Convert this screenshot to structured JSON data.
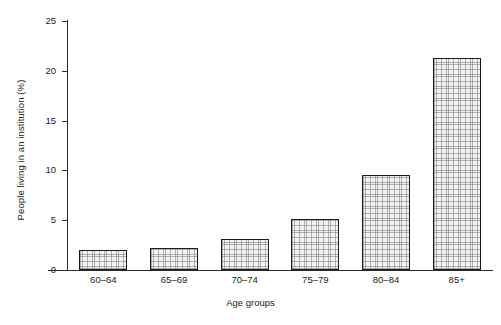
{
  "chart_data": {
    "type": "bar",
    "title": "",
    "subtitle": "",
    "xlabel": "Age groups",
    "ylabel": "People living in an institution (%)",
    "categories": [
      "60–64",
      "65–69",
      "70–74",
      "75–79",
      "80–84",
      "85+"
    ],
    "values": [
      2.0,
      2.2,
      3.1,
      5.1,
      9.5,
      21.3
    ],
    "ylim": [
      0,
      25
    ],
    "yticks": [
      0,
      5,
      10,
      15,
      20,
      25
    ],
    "ytick_labels": [
      "0",
      "5",
      "10",
      "15",
      "20",
      "25"
    ],
    "grid": false,
    "legend": null,
    "legend_position": "none",
    "bar_edge_color": "#1c1c1c",
    "bar_fill_color": "#f3f3f3",
    "axis_color": "#2b2b2b",
    "background_color": "#ffffff"
  }
}
